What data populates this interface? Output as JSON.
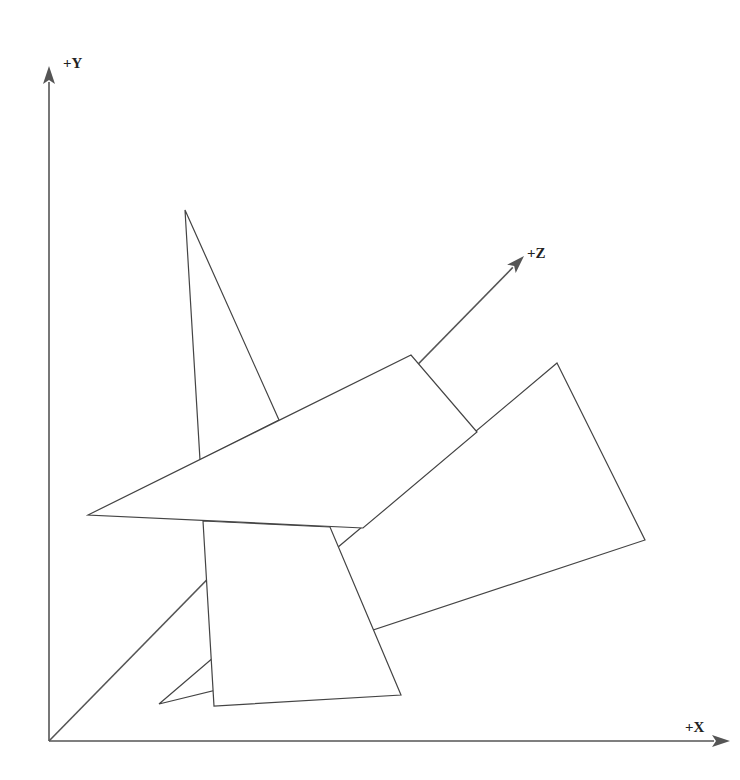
{
  "diagram": {
    "title": "",
    "axes": {
      "origin": [
        49,
        741
      ],
      "x": {
        "label": "+X",
        "end": [
          730,
          741
        ],
        "label_pos": [
          685,
          720
        ]
      },
      "y": {
        "label": "+Y",
        "end": [
          49,
          66
        ],
        "label_pos": [
          63,
          56
        ]
      },
      "z": {
        "label": "+Z",
        "end": [
          524,
          256
        ],
        "label_pos": [
          527,
          246
        ]
      }
    },
    "polygons": [
      {
        "name": "small-triangle",
        "points": [
          [
            159,
            704
          ],
          [
            214,
            657
          ],
          [
            216,
            690
          ]
        ]
      },
      {
        "name": "tall-triangle",
        "points": [
          [
            185,
            210
          ],
          [
            279,
            420
          ],
          [
            200,
            460
          ]
        ]
      },
      {
        "name": "right-quad",
        "points": [
          [
            557,
            363
          ],
          [
            645,
            540
          ],
          [
            373,
            630
          ],
          [
            337,
            548
          ]
        ]
      },
      {
        "name": "lower-quad",
        "points": [
          [
            203,
            521
          ],
          [
            330,
            527
          ],
          [
            401,
            695
          ],
          [
            214,
            706
          ]
        ]
      },
      {
        "name": "big-quad",
        "points": [
          [
            88,
            515
          ],
          [
            411,
            355
          ],
          [
            477,
            432
          ],
          [
            363,
            528
          ]
        ]
      }
    ],
    "colors": {
      "axis": "#555555",
      "stroke": "#444444",
      "fill": "#ffffff",
      "background": "#ffffff"
    }
  }
}
